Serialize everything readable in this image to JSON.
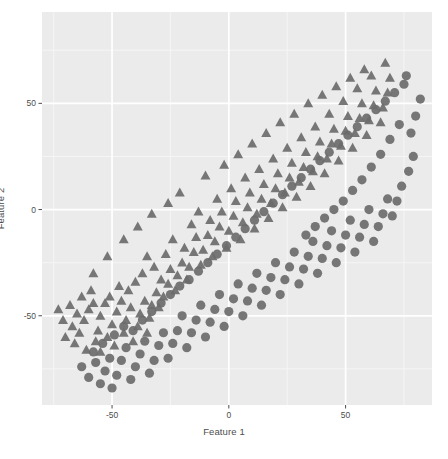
{
  "figure": {
    "panel_bg": "#ebebeb",
    "page_bg": "#ffffff",
    "grid_major_color": "#ffffff",
    "grid_minor_color": "#f5f5f5",
    "marker_color": "#6b6b6b",
    "text_color": "#4d4d4d",
    "panel": {
      "x": 42,
      "y": 12,
      "width": 390,
      "height": 393
    }
  },
  "chart_data": {
    "type": "scatter",
    "title": "",
    "xlabel": "Feature 1",
    "ylabel": "Feature 2",
    "xlim": [
      -80,
      87
    ],
    "ylim": [
      -92,
      93
    ],
    "xticks": [
      -50,
      0,
      50
    ],
    "xticklabels": [
      "-50",
      "0",
      "50"
    ],
    "yticks": [
      -50,
      0,
      50
    ],
    "yticklabels": [
      "-50",
      "0",
      "50"
    ],
    "grid": true,
    "grid_major": {
      "x": [
        -50,
        0,
        50
      ],
      "y": [
        -50,
        0,
        50
      ]
    },
    "grid_minor": {
      "x": [
        -75,
        -25,
        25,
        75
      ],
      "y": [
        -75,
        -25,
        25,
        75
      ]
    },
    "legend": null,
    "series": [
      {
        "name": "Class 0",
        "marker": "triangle",
        "color": "#6b6b6b",
        "points": [
          [
            -73,
            -47
          ],
          [
            -71,
            -52
          ],
          [
            -68,
            -45
          ],
          [
            -67,
            -55
          ],
          [
            -65,
            -49
          ],
          [
            -64,
            -58
          ],
          [
            -70,
            -60
          ],
          [
            -66,
            -63
          ],
          [
            -62,
            -52
          ],
          [
            -60,
            -47
          ],
          [
            -63,
            -41
          ],
          [
            -58,
            -44
          ],
          [
            -61,
            -66
          ],
          [
            -57,
            -62
          ],
          [
            -56,
            -57
          ],
          [
            -55,
            -50
          ],
          [
            -53,
            -44
          ],
          [
            -59,
            -38
          ],
          [
            -55,
            -67
          ],
          [
            -52,
            -60
          ],
          [
            -50,
            -54
          ],
          [
            -48,
            -48
          ],
          [
            -51,
            -41
          ],
          [
            -46,
            -43
          ],
          [
            -49,
            -64
          ],
          [
            -45,
            -58
          ],
          [
            -44,
            -52
          ],
          [
            -42,
            -46
          ],
          [
            -47,
            -36
          ],
          [
            -43,
            -38
          ],
          [
            -41,
            -62
          ],
          [
            -39,
            -55
          ],
          [
            -38,
            -49
          ],
          [
            -36,
            -43
          ],
          [
            -40,
            -34
          ],
          [
            -37,
            -30
          ],
          [
            -35,
            -58
          ],
          [
            -34,
            -51
          ],
          [
            -33,
            -45
          ],
          [
            -31,
            -39
          ],
          [
            -29,
            -33
          ],
          [
            -32,
            -27
          ],
          [
            -35,
            -22
          ],
          [
            -30,
            -46
          ],
          [
            -28,
            -41
          ],
          [
            -26,
            -35
          ],
          [
            -25,
            -28
          ],
          [
            -27,
            -21
          ],
          [
            -23,
            -38
          ],
          [
            -22,
            -31
          ],
          [
            -20,
            -25
          ],
          [
            -19,
            -18
          ],
          [
            -24,
            -14
          ],
          [
            -18,
            -33
          ],
          [
            -17,
            -27
          ],
          [
            -15,
            -20
          ],
          [
            -14,
            -13
          ],
          [
            -16,
            -7
          ],
          [
            -12,
            -26
          ],
          [
            -11,
            -19
          ],
          [
            -9,
            -12
          ],
          [
            -8,
            -5
          ],
          [
            -13,
            -1
          ],
          [
            -7,
            -22
          ],
          [
            -6,
            -15
          ],
          [
            -4,
            -8
          ],
          [
            -3,
            -1
          ],
          [
            -5,
            5
          ],
          [
            -1,
            -18
          ],
          [
            0,
            -10
          ],
          [
            2,
            -3
          ],
          [
            3,
            4
          ],
          [
            1,
            10
          ],
          [
            5,
            -14
          ],
          [
            6,
            -6
          ],
          [
            8,
            1
          ],
          [
            9,
            8
          ],
          [
            7,
            15
          ],
          [
            11,
            -9
          ],
          [
            12,
            -2
          ],
          [
            14,
            5
          ],
          [
            15,
            12
          ],
          [
            13,
            19
          ],
          [
            17,
            -4
          ],
          [
            18,
            3
          ],
          [
            20,
            10
          ],
          [
            21,
            17
          ],
          [
            19,
            24
          ],
          [
            23,
            1
          ],
          [
            24,
            8
          ],
          [
            26,
            15
          ],
          [
            27,
            22
          ],
          [
            25,
            29
          ],
          [
            29,
            6
          ],
          [
            30,
            13
          ],
          [
            32,
            20
          ],
          [
            33,
            27
          ],
          [
            31,
            34
          ],
          [
            35,
            11
          ],
          [
            36,
            18
          ],
          [
            38,
            25
          ],
          [
            39,
            32
          ],
          [
            37,
            39
          ],
          [
            41,
            17
          ],
          [
            42,
            24
          ],
          [
            44,
            31
          ],
          [
            45,
            38
          ],
          [
            43,
            45
          ],
          [
            47,
            23
          ],
          [
            48,
            30
          ],
          [
            50,
            37
          ],
          [
            51,
            44
          ],
          [
            49,
            51
          ],
          [
            53,
            29
          ],
          [
            54,
            36
          ],
          [
            56,
            43
          ],
          [
            57,
            50
          ],
          [
            55,
            57
          ],
          [
            59,
            35
          ],
          [
            60,
            42
          ],
          [
            62,
            49
          ],
          [
            63,
            56
          ],
          [
            61,
            63
          ],
          [
            65,
            41
          ],
          [
            66,
            48
          ],
          [
            68,
            55
          ],
          [
            69,
            62
          ],
          [
            67,
            69
          ],
          [
            58,
            66
          ],
          [
            52,
            62
          ],
          [
            46,
            58
          ],
          [
            40,
            54
          ],
          [
            34,
            50
          ],
          [
            28,
            45
          ],
          [
            22,
            41
          ],
          [
            16,
            36
          ],
          [
            10,
            31
          ],
          [
            4,
            26
          ],
          [
            -2,
            21
          ],
          [
            -10,
            16
          ],
          [
            -21,
            8
          ],
          [
            -26,
            3
          ],
          [
            -33,
            -2
          ],
          [
            -39,
            -8
          ],
          [
            -45,
            -14
          ],
          [
            -52,
            -22
          ],
          [
            -58,
            -30
          ]
        ]
      },
      {
        "name": "Class 1",
        "marker": "circle",
        "color": "#6b6b6b",
        "points": [
          [
            -63,
            -74
          ],
          [
            -60,
            -79
          ],
          [
            -57,
            -72
          ],
          [
            -55,
            -82
          ],
          [
            -53,
            -76
          ],
          [
            -51,
            -70
          ],
          [
            -58,
            -67
          ],
          [
            -54,
            -63
          ],
          [
            -50,
            -84
          ],
          [
            -48,
            -78
          ],
          [
            -46,
            -71
          ],
          [
            -44,
            -65
          ],
          [
            -49,
            -59
          ],
          [
            -45,
            -55
          ],
          [
            -42,
            -80
          ],
          [
            -40,
            -74
          ],
          [
            -38,
            -68
          ],
          [
            -36,
            -62
          ],
          [
            -41,
            -57
          ],
          [
            -37,
            -52
          ],
          [
            -34,
            -77
          ],
          [
            -32,
            -71
          ],
          [
            -30,
            -64
          ],
          [
            -28,
            -58
          ],
          [
            -33,
            -48
          ],
          [
            -29,
            -44
          ],
          [
            -26,
            -70
          ],
          [
            -24,
            -63
          ],
          [
            -22,
            -57
          ],
          [
            -20,
            -50
          ],
          [
            -25,
            -40
          ],
          [
            -21,
            -36
          ],
          [
            -18,
            -65
          ],
          [
            -16,
            -58
          ],
          [
            -14,
            -52
          ],
          [
            -12,
            -45
          ],
          [
            -17,
            -33
          ],
          [
            -13,
            -29
          ],
          [
            -10,
            -60
          ],
          [
            -8,
            -53
          ],
          [
            -6,
            -47
          ],
          [
            -4,
            -40
          ],
          [
            -9,
            -25
          ],
          [
            -5,
            -21
          ],
          [
            -2,
            -55
          ],
          [
            0,
            -48
          ],
          [
            2,
            -42
          ],
          [
            4,
            -35
          ],
          [
            -1,
            -17
          ],
          [
            3,
            -13
          ],
          [
            6,
            -50
          ],
          [
            8,
            -43
          ],
          [
            10,
            -37
          ],
          [
            12,
            -30
          ],
          [
            7,
            -9
          ],
          [
            11,
            -5
          ],
          [
            14,
            -45
          ],
          [
            16,
            -38
          ],
          [
            18,
            -32
          ],
          [
            20,
            -25
          ],
          [
            15,
            -1
          ],
          [
            19,
            3
          ],
          [
            22,
            -40
          ],
          [
            24,
            -33
          ],
          [
            26,
            -27
          ],
          [
            28,
            -20
          ],
          [
            23,
            7
          ],
          [
            27,
            11
          ],
          [
            30,
            -35
          ],
          [
            32,
            -28
          ],
          [
            34,
            -22
          ],
          [
            36,
            -15
          ],
          [
            31,
            15
          ],
          [
            35,
            19
          ],
          [
            38,
            -30
          ],
          [
            40,
            -23
          ],
          [
            42,
            -17
          ],
          [
            44,
            -10
          ],
          [
            39,
            23
          ],
          [
            43,
            27
          ],
          [
            46,
            -25
          ],
          [
            48,
            -18
          ],
          [
            50,
            -12
          ],
          [
            52,
            -5
          ],
          [
            47,
            31
          ],
          [
            51,
            35
          ],
          [
            54,
            -20
          ],
          [
            56,
            -13
          ],
          [
            58,
            -7
          ],
          [
            60,
            0
          ],
          [
            55,
            39
          ],
          [
            59,
            43
          ],
          [
            62,
            -15
          ],
          [
            64,
            -8
          ],
          [
            66,
            -2
          ],
          [
            68,
            5
          ],
          [
            63,
            47
          ],
          [
            67,
            51
          ],
          [
            70,
            -3
          ],
          [
            72,
            4
          ],
          [
            74,
            11
          ],
          [
            71,
            55
          ],
          [
            75,
            59
          ],
          [
            77,
            18
          ],
          [
            79,
            25
          ],
          [
            76,
            63
          ],
          [
            80,
            44
          ],
          [
            82,
            52
          ],
          [
            78,
            36
          ],
          [
            73,
            40
          ],
          [
            69,
            33
          ],
          [
            65,
            26
          ],
          [
            61,
            20
          ],
          [
            57,
            14
          ],
          [
            53,
            9
          ],
          [
            49,
            4
          ],
          [
            45,
            0
          ],
          [
            41,
            -4
          ],
          [
            37,
            -8
          ],
          [
            33,
            -12
          ]
        ]
      }
    ]
  },
  "axis_titles": {
    "x": "Feature 1",
    "y": "Feature 2"
  }
}
